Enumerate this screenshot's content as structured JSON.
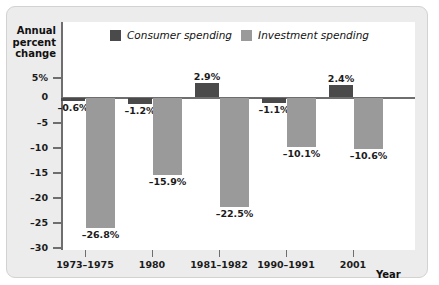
{
  "chart_data": {
    "type": "bar",
    "title": "",
    "ylabel": "Annual percent change",
    "xlabel": "Year",
    "ylim": [
      -30,
      5
    ],
    "yticks": [
      5,
      0,
      -5,
      -10,
      -15,
      -20,
      -25,
      -30
    ],
    "ytick_labels": [
      "5%",
      "0",
      "–5",
      "–10",
      "–15",
      "–20",
      "–25",
      "–30"
    ],
    "categories": [
      "1973–1975",
      "1980",
      "1981–1982",
      "1990–1991",
      "2001"
    ],
    "grid": false,
    "legend_position": "top-center",
    "series": [
      {
        "name": "Consumer spending",
        "color": "#4a4a4a",
        "values": [
          -0.6,
          -1.2,
          2.9,
          -1.1,
          2.4
        ],
        "labels": [
          "–0.6%",
          "–1.2%",
          "2.9%",
          "–1.1%",
          "2.4%"
        ]
      },
      {
        "name": "Investment spending",
        "color": "#9a9a9a",
        "values": [
          -26.8,
          -15.9,
          -22.5,
          -10.1,
          -10.6
        ],
        "labels": [
          "–26.8%",
          "–15.9%",
          "–22.5%",
          "–10.1%",
          "–10.6%"
        ]
      }
    ]
  },
  "axis": {
    "y_title_lines": [
      "Annual",
      "percent",
      "change"
    ],
    "x_title": "Year"
  },
  "colors": {
    "consumer": "#4a4a4a",
    "investment": "#9a9a9a",
    "panel": "#ececec",
    "plot": "#ffffff",
    "axis": "#6e6e6e"
  }
}
